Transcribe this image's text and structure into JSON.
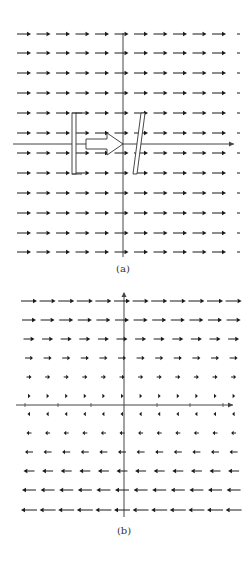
{
  "figure": {
    "panels": [
      {
        "id": "a",
        "caption": "(a)",
        "description": "Uniform velocity field (all arrows pointing right) with a vertical plate, a hollow flow arrow, and a slanted plate",
        "grid": {
          "rows": 12,
          "cols": 12,
          "row_y": [
            34,
            53,
            73,
            93,
            113,
            133,
            153,
            173,
            193,
            213,
            233,
            252
          ],
          "col_x0": 17,
          "col_dx": 19.5,
          "direction": "right",
          "arrow_length": 14
        },
        "axes": {
          "x_axis_y": 144,
          "x_from": 13,
          "x_to": 234,
          "y_axis_x": 123,
          "y_from": 33,
          "y_to": 257
        },
        "shapes": {
          "vertical_plate": {
            "x": 72,
            "y": 113,
            "w": 4,
            "h": 61
          },
          "hollow_arrow": {
            "x_start": 86,
            "x_end": 123,
            "y_center": 144,
            "body_h": 10,
            "head_h": 22,
            "head_len": 16
          },
          "slanted_plate": {
            "top": [
              143,
              113
            ],
            "bottom": [
              135,
              174
            ],
            "width": 4
          }
        }
      },
      {
        "id": "b",
        "caption": "(b)",
        "description": "Shear flow: rightward arrows above the x-axis decreasing toward it, leftward arrows below increasing away from it",
        "grid": {
          "cols": 12,
          "col_x0": 25,
          "col_dx": 18.6,
          "rows_above": [
            {
              "y": 301,
              "length": 16
            },
            {
              "y": 320,
              "length": 14
            },
            {
              "y": 339,
              "length": 11
            },
            {
              "y": 358,
              "length": 8
            },
            {
              "y": 377,
              "length": 5
            },
            {
              "y": 396,
              "length": 3
            }
          ],
          "rows_below": [
            {
              "y": 414,
              "length": 3
            },
            {
              "y": 433,
              "length": 5
            },
            {
              "y": 452,
              "length": 8
            },
            {
              "y": 471,
              "length": 11
            },
            {
              "y": 490,
              "length": 14
            },
            {
              "y": 510,
              "length": 16
            }
          ]
        },
        "axes": {
          "x_axis_y": 405,
          "x_from": 16,
          "x_to": 233,
          "y_axis_x": 124,
          "y_from": 293,
          "y_to": 517,
          "x_ticks": [
            25,
            58,
            91,
            157,
            190,
            223
          ]
        }
      }
    ],
    "colors": {
      "ink": "#1a1a1a",
      "axis": "#444444",
      "background": "#ffffff"
    }
  }
}
